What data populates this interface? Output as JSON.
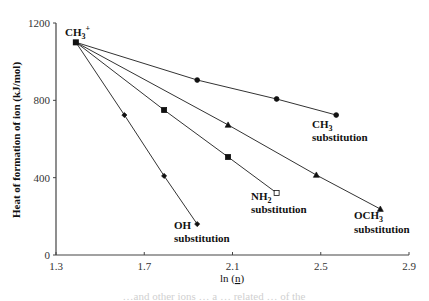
{
  "chart_data": {
    "type": "line",
    "title": "",
    "xlabel": "ln (n)",
    "xlabel_main": "ln (",
    "xlabel_var": "n",
    "xlabel_close": ")",
    "ylabel": "Heat of formation of ion (kJ/mol)",
    "xlim": [
      1.3,
      2.9
    ],
    "ylim": [
      0,
      1200
    ],
    "xticks": [
      "1.3",
      "1.7",
      "2.1",
      "2.5",
      "2.9"
    ],
    "xtick_values": [
      1.3,
      1.7,
      2.1,
      2.5,
      2.9
    ],
    "yticks": [
      "0",
      "400",
      "800",
      "1200"
    ],
    "ytick_values": [
      0,
      400,
      800,
      1200
    ],
    "grid": false,
    "legend": "none (inline annotations)",
    "origin_point": {
      "label_main": "CH",
      "label_sub": "3",
      "label_sup": "+",
      "x": 1.39,
      "y": 1100
    },
    "series": [
      {
        "name": "CH3 substitution",
        "label_main": "CH",
        "label_sub": "3",
        "label_line2": "substitution",
        "marker": "circle",
        "x": [
          1.39,
          1.94,
          2.3,
          2.57
        ],
        "y": [
          1100,
          905,
          807,
          724
        ]
      },
      {
        "name": "OCH3 substitution",
        "label_main": "OCH",
        "label_sub": "3",
        "label_line2": "substitution",
        "marker": "triangle",
        "x": [
          1.39,
          2.08,
          2.48,
          2.77
        ],
        "y": [
          1100,
          673,
          414,
          238
        ]
      },
      {
        "name": "NH2 substitution",
        "label_main": "NH",
        "label_sub": "2",
        "label_line2": "substitution",
        "marker": "square",
        "last_marker_hollow": true,
        "x": [
          1.39,
          1.79,
          2.08,
          2.3
        ],
        "y": [
          1100,
          750,
          507,
          321
        ]
      },
      {
        "name": "OH substitution",
        "label_main": "OH",
        "label_sub": "",
        "label_line2": "substitution",
        "marker": "diamond",
        "x": [
          1.39,
          1.61,
          1.79,
          1.94
        ],
        "y": [
          1100,
          724,
          409,
          160
        ]
      }
    ]
  },
  "caption_fragment": "…and other ions … a … related … of the"
}
